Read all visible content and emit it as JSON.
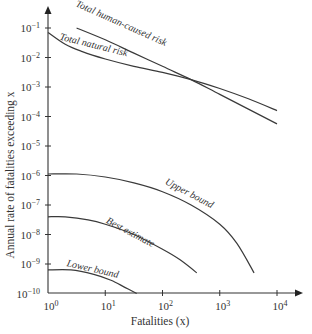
{
  "chart_data": {
    "type": "line",
    "title": "",
    "xlabel": "Fatalities (x)",
    "ylabel": "Annual rate of fatalities exceeding x",
    "xscale": "log",
    "yscale": "log",
    "xlim_exp": [
      0,
      4
    ],
    "ylim_exp": [
      -10,
      -1
    ],
    "x_tick_labels": [
      "10^0",
      "10^1",
      "10^2",
      "10^3",
      "10^4"
    ],
    "y_tick_labels": [
      "10^-1",
      "10^-2",
      "10^-3",
      "10^-4",
      "10^-5",
      "10^-6",
      "10^-7",
      "10^-8",
      "10^-9",
      "10^-10"
    ],
    "grid": false,
    "legend": "inline labels",
    "series": [
      {
        "name": "Total human-caused risk",
        "label_angle": 24,
        "log_points": [
          [
            0.5,
            -1.0
          ],
          [
            1.0,
            -1.4
          ],
          [
            1.5,
            -1.85
          ],
          [
            2.0,
            -2.3
          ],
          [
            2.5,
            -2.75
          ],
          [
            3.0,
            -3.25
          ],
          [
            3.5,
            -3.75
          ],
          [
            4.0,
            -4.25
          ]
        ]
      },
      {
        "name": "Total natural risk",
        "label_angle": 14,
        "log_points": [
          [
            0.0,
            -1.15
          ],
          [
            0.3,
            -1.55
          ],
          [
            0.6,
            -1.8
          ],
          [
            1.0,
            -2.05
          ],
          [
            1.5,
            -2.3
          ],
          [
            2.0,
            -2.5
          ],
          [
            2.5,
            -2.75
          ],
          [
            3.0,
            -3.05
          ],
          [
            3.5,
            -3.4
          ],
          [
            4.0,
            -3.8
          ]
        ]
      },
      {
        "name": "Upper bound",
        "label_angle": 28,
        "log_points": [
          [
            0.0,
            -5.95
          ],
          [
            0.5,
            -5.95
          ],
          [
            1.0,
            -6.05
          ],
          [
            1.5,
            -6.25
          ],
          [
            2.0,
            -6.55
          ],
          [
            2.5,
            -7.0
          ],
          [
            3.0,
            -7.65
          ],
          [
            3.3,
            -8.3
          ],
          [
            3.6,
            -9.3
          ]
        ]
      },
      {
        "name": "Best estimate",
        "label_angle": 28,
        "log_points": [
          [
            0.0,
            -7.4
          ],
          [
            0.3,
            -7.4
          ],
          [
            0.7,
            -7.5
          ],
          [
            1.0,
            -7.65
          ],
          [
            1.5,
            -8.0
          ],
          [
            2.0,
            -8.5
          ],
          [
            2.3,
            -8.85
          ],
          [
            2.6,
            -9.3
          ]
        ]
      },
      {
        "name": "Lower bound",
        "label_angle": 13,
        "log_points": [
          [
            0.0,
            -9.2
          ],
          [
            0.4,
            -9.2
          ],
          [
            0.8,
            -9.35
          ],
          [
            1.1,
            -9.55
          ],
          [
            1.35,
            -9.8
          ],
          [
            1.55,
            -10.0
          ]
        ]
      }
    ]
  }
}
